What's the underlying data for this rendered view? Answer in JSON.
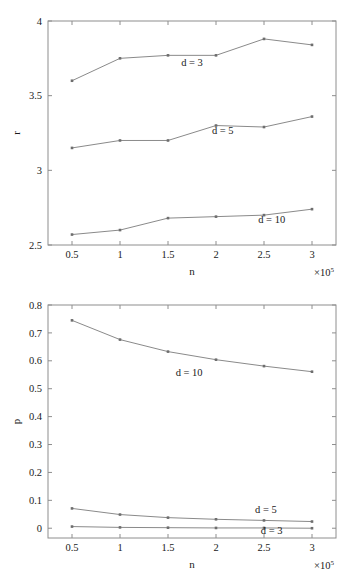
{
  "chart_data": [
    {
      "type": "line",
      "title": "",
      "xlabel": "n",
      "ylabel": "r",
      "x": [
        0.5,
        1,
        1.5,
        2,
        2.5,
        3
      ],
      "xtick_labels": [
        "0.5",
        "1",
        "1.5",
        "2",
        "2.5",
        "3"
      ],
      "ytick_labels": [
        "2.5",
        "3",
        "3.5",
        "4"
      ],
      "yticks": [
        2.5,
        3,
        3.5,
        4
      ],
      "xlim": [
        0.25,
        3.25
      ],
      "ylim": [
        2.5,
        4
      ],
      "x_multiplier": "×10",
      "x_multiplier_exp": "5",
      "grid": false,
      "legend_position": "inline-annotation",
      "series": [
        {
          "name": "d = 3",
          "label": "d = 3",
          "values": [
            3.6,
            3.75,
            3.77,
            3.77,
            3.88,
            3.84
          ]
        },
        {
          "name": "d = 5",
          "label": "d = 5",
          "values": [
            3.15,
            3.2,
            3.2,
            3.3,
            3.29,
            3.36
          ]
        },
        {
          "name": "d = 10",
          "label": "d = 10",
          "values": [
            2.57,
            2.6,
            2.68,
            2.69,
            2.7,
            2.74
          ]
        }
      ],
      "annotations": [
        {
          "text": "d = 3",
          "x": 1.75,
          "y": 3.7
        },
        {
          "text": "d = 5",
          "x": 2.07,
          "y": 3.245
        },
        {
          "text": "d = 10",
          "x": 2.58,
          "y": 2.645
        }
      ]
    },
    {
      "type": "line",
      "title": "",
      "xlabel": "n",
      "ylabel": "p",
      "x": [
        0.5,
        1,
        1.5,
        2,
        2.5,
        3
      ],
      "xtick_labels": [
        "0.5",
        "1",
        "1.5",
        "2",
        "2.5",
        "3"
      ],
      "ytick_labels": [
        "0",
        "0.1",
        "0.2",
        "0.3",
        "0.4",
        "0.5",
        "0.6",
        "0.7",
        "0.8"
      ],
      "yticks": [
        0,
        0.1,
        0.2,
        0.3,
        0.4,
        0.5,
        0.6,
        0.7,
        0.8
      ],
      "xlim": [
        0.25,
        3.25
      ],
      "ylim": [
        -0.035,
        0.8
      ],
      "x_multiplier": "×10",
      "x_multiplier_exp": "5",
      "grid": false,
      "legend_position": "inline-annotation",
      "series": [
        {
          "name": "d = 10",
          "label": "d = 10",
          "values": [
            0.745,
            0.676,
            0.633,
            0.604,
            0.581,
            0.561
          ]
        },
        {
          "name": "d = 5",
          "label": "d = 5",
          "values": [
            0.071,
            0.049,
            0.038,
            0.032,
            0.028,
            0.024
          ]
        },
        {
          "name": "d = 3",
          "label": "d = 3",
          "values": [
            0.006,
            0.003,
            0.002,
            0.001,
            0.001,
            0.0
          ]
        }
      ],
      "annotations": [
        {
          "text": "d = 10",
          "x": 1.72,
          "y": 0.545
        },
        {
          "text": "d = 5",
          "x": 2.52,
          "y": 0.055
        },
        {
          "text": "d = 3",
          "x": 2.58,
          "y": -0.022
        }
      ]
    }
  ],
  "colors": {
    "line": "#8a8a8a",
    "marker": "#6e6e6e",
    "axis": "#8e8e8e",
    "text": "#1a1a1a",
    "background": "#ffffff"
  }
}
